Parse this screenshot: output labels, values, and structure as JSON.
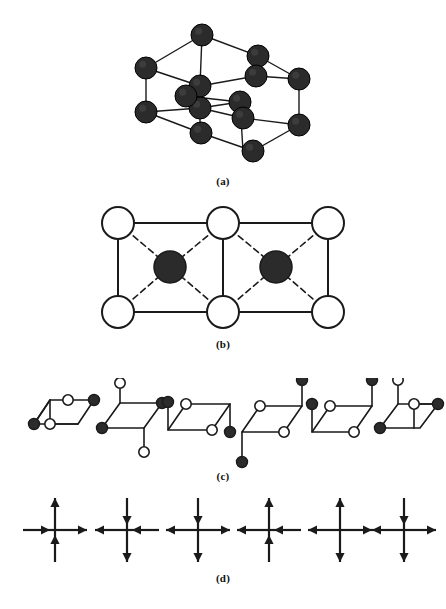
{
  "figure": {
    "colors": {
      "line": "#1a1a1a",
      "filled_atom": "#2b2b2b",
      "open_atom_fill": "#ffffff",
      "background": "#ffffff"
    }
  },
  "panels": [
    {
      "id": "a",
      "label": "(a)",
      "type": "3d-lattice",
      "atom_style": "filled",
      "atom_count": 14,
      "atom_radius": 11,
      "atoms": [
        {
          "cx": 146,
          "cy": 60
        },
        {
          "cx": 202,
          "cy": 27
        },
        {
          "cx": 258,
          "cy": 48
        },
        {
          "cx": 200,
          "cy": 78
        },
        {
          "cx": 256,
          "cy": 68
        },
        {
          "cx": 299,
          "cy": 71
        },
        {
          "cx": 200,
          "cy": 100
        },
        {
          "cx": 240,
          "cy": 94
        },
        {
          "cx": 243,
          "cy": 110
        },
        {
          "cx": 146,
          "cy": 104
        },
        {
          "cx": 201,
          "cy": 125
        },
        {
          "cx": 299,
          "cy": 117
        },
        {
          "cx": 253,
          "cy": 143
        },
        {
          "cx": 186,
          "cy": 88
        }
      ],
      "edges": [
        {
          "x1": 146,
          "y1": 60,
          "x2": 202,
          "y2": 27
        },
        {
          "x1": 202,
          "y1": 27,
          "x2": 258,
          "y2": 48
        },
        {
          "x1": 146,
          "y1": 60,
          "x2": 200,
          "y2": 78
        },
        {
          "x1": 200,
          "y1": 78,
          "x2": 256,
          "y2": 68
        },
        {
          "x1": 256,
          "y1": 68,
          "x2": 299,
          "y2": 71
        },
        {
          "x1": 258,
          "y1": 48,
          "x2": 299,
          "y2": 71
        },
        {
          "x1": 202,
          "y1": 27,
          "x2": 200,
          "y2": 78
        },
        {
          "x1": 146,
          "y1": 60,
          "x2": 146,
          "y2": 104
        },
        {
          "x1": 256,
          "y1": 68,
          "x2": 256,
          "y2": 68
        },
        {
          "x1": 299,
          "y1": 71,
          "x2": 299,
          "y2": 117
        },
        {
          "x1": 146,
          "y1": 104,
          "x2": 201,
          "y2": 125
        },
        {
          "x1": 201,
          "y1": 125,
          "x2": 253,
          "y2": 143
        },
        {
          "x1": 253,
          "y1": 143,
          "x2": 299,
          "y2": 117
        },
        {
          "x1": 146,
          "y1": 104,
          "x2": 200,
          "y2": 100
        },
        {
          "x1": 200,
          "y1": 100,
          "x2": 243,
          "y2": 110
        },
        {
          "x1": 243,
          "y1": 110,
          "x2": 299,
          "y2": 117
        },
        {
          "x1": 200,
          "y1": 78,
          "x2": 200,
          "y2": 125
        },
        {
          "x1": 240,
          "y1": 94,
          "x2": 243,
          "y2": 143
        },
        {
          "x1": 200,
          "y1": 100,
          "x2": 240,
          "y2": 94
        },
        {
          "x1": 186,
          "y1": 88,
          "x2": 240,
          "y2": 94
        }
      ]
    },
    {
      "id": "b",
      "label": "(b)",
      "type": "unit-cell-2d",
      "open_atoms": [
        {
          "cx": 118,
          "cy": 18
        },
        {
          "cx": 223,
          "cy": 18
        },
        {
          "cx": 328,
          "cy": 18
        },
        {
          "cx": 118,
          "cy": 107
        },
        {
          "cx": 223,
          "cy": 107
        },
        {
          "cx": 328,
          "cy": 107
        }
      ],
      "filled_atoms": [
        {
          "cx": 170,
          "cy": 62
        },
        {
          "cx": 276,
          "cy": 62
        }
      ],
      "open_radius": 16,
      "filled_radius": 16,
      "solid_edges": [
        {
          "x1": 118,
          "y1": 18,
          "x2": 328,
          "y2": 18
        },
        {
          "x1": 118,
          "y1": 107,
          "x2": 328,
          "y2": 107
        },
        {
          "x1": 118,
          "y1": 18,
          "x2": 118,
          "y2": 107
        },
        {
          "x1": 223,
          "y1": 18,
          "x2": 223,
          "y2": 107
        },
        {
          "x1": 328,
          "y1": 18,
          "x2": 328,
          "y2": 107
        }
      ],
      "dashed_edges": [
        {
          "x1": 118,
          "y1": 18,
          "x2": 170,
          "y2": 62
        },
        {
          "x1": 223,
          "y1": 18,
          "x2": 170,
          "y2": 62
        },
        {
          "x1": 118,
          "y1": 107,
          "x2": 170,
          "y2": 62
        },
        {
          "x1": 223,
          "y1": 107,
          "x2": 170,
          "y2": 62
        },
        {
          "x1": 223,
          "y1": 18,
          "x2": 276,
          "y2": 62
        },
        {
          "x1": 328,
          "y1": 18,
          "x2": 276,
          "y2": 62
        },
        {
          "x1": 223,
          "y1": 107,
          "x2": 276,
          "y2": 62
        },
        {
          "x1": 328,
          "y1": 107,
          "x2": 276,
          "y2": 62
        }
      ]
    },
    {
      "id": "c",
      "label": "(c)",
      "type": "motif-row",
      "motif_count": 6,
      "motifs": [
        {
          "index": 1,
          "origin_x": 22,
          "origin_y": 0,
          "parallelogram": [
            {
              "x": 12,
              "y": 46
            },
            {
              "x": 28,
              "y": 22
            },
            {
              "x": 72,
              "y": 22
            },
            {
              "x": 56,
              "y": 46
            }
          ],
          "inner_lines": [
            {
              "x1": 28,
              "y1": 22,
              "x2": 28,
              "y2": 46
            },
            {
              "x1": 28,
              "y1": 46,
              "x2": 56,
              "y2": 46
            },
            {
              "x1": 28,
              "y1": 22,
              "x2": 12,
              "y2": 46
            }
          ],
          "stems": [
            {
              "x1": 72,
              "y1": 22,
              "x2": 72,
              "y2": 22
            },
            {
              "x1": 12,
              "y1": 46,
              "x2": 12,
              "y2": 46
            }
          ],
          "open_nodes": [
            {
              "cx": 46,
              "cy": 22
            },
            {
              "cx": 28,
              "cy": 46
            }
          ],
          "filled_nodes": [
            {
              "cx": 72,
              "cy": 22
            },
            {
              "cx": 12,
              "cy": 46
            }
          ]
        },
        {
          "index": 2,
          "origin_x": 92,
          "origin_y": 0,
          "parallelogram": [
            {
              "x": 10,
              "y": 50
            },
            {
              "x": 28,
              "y": 25
            },
            {
              "x": 70,
              "y": 25
            },
            {
              "x": 52,
              "y": 50
            }
          ],
          "inner_lines": [],
          "stems": [
            {
              "x1": 28,
              "y1": 25,
              "x2": 28,
              "y2": 5
            },
            {
              "x1": 52,
              "y1": 50,
              "x2": 52,
              "y2": 74
            }
          ],
          "open_nodes": [
            {
              "cx": 28,
              "cy": 5
            },
            {
              "cx": 52,
              "cy": 74
            }
          ],
          "filled_nodes": [
            {
              "cx": 70,
              "cy": 25
            },
            {
              "cx": 10,
              "cy": 50
            }
          ]
        },
        {
          "index": 3,
          "origin_x": 158,
          "origin_y": 0,
          "parallelogram": [
            {
              "x": 10,
              "y": 52
            },
            {
              "x": 28,
              "y": 26
            },
            {
              "x": 72,
              "y": 26
            },
            {
              "x": 54,
              "y": 52
            }
          ],
          "inner_lines": [],
          "stems": [
            {
              "x1": 10,
              "y1": 52,
              "x2": 10,
              "y2": 24
            },
            {
              "x1": 72,
              "y1": 26,
              "x2": 72,
              "y2": 54
            }
          ],
          "open_nodes": [
            {
              "cx": 28,
              "cy": 26
            },
            {
              "cx": 54,
              "cy": 52
            }
          ],
          "filled_nodes": [
            {
              "cx": 10,
              "cy": 24
            },
            {
              "cx": 72,
              "cy": 54
            }
          ]
        },
        {
          "index": 4,
          "origin_x": 232,
          "origin_y": 0,
          "parallelogram": [
            {
              "x": 10,
              "y": 54
            },
            {
              "x": 28,
              "y": 28
            },
            {
              "x": 70,
              "y": 28
            },
            {
              "x": 52,
              "y": 54
            }
          ],
          "inner_lines": [],
          "stems": [
            {
              "x1": 10,
              "y1": 54,
              "x2": 10,
              "y2": 84
            },
            {
              "x1": 70,
              "y1": 28,
              "x2": 70,
              "y2": 2
            }
          ],
          "open_nodes": [
            {
              "cx": 28,
              "cy": 28
            },
            {
              "cx": 52,
              "cy": 54
            }
          ],
          "filled_nodes": [
            {
              "cx": 10,
              "cy": 84
            },
            {
              "cx": 70,
              "cy": 2
            }
          ]
        },
        {
          "index": 5,
          "origin_x": 302,
          "origin_y": 0,
          "parallelogram": [
            {
              "x": 10,
              "y": 54
            },
            {
              "x": 28,
              "y": 28
            },
            {
              "x": 70,
              "y": 28
            },
            {
              "x": 52,
              "y": 54
            }
          ],
          "inner_lines": [],
          "stems": [
            {
              "x1": 10,
              "y1": 54,
              "x2": 10,
              "y2": 26
            },
            {
              "x1": 70,
              "y1": 28,
              "x2": 70,
              "y2": 2
            }
          ],
          "open_nodes": [
            {
              "cx": 28,
              "cy": 28
            },
            {
              "cx": 52,
              "cy": 54
            }
          ],
          "filled_nodes": [
            {
              "cx": 10,
              "cy": 26
            },
            {
              "cx": 70,
              "cy": 2
            }
          ]
        },
        {
          "index": 6,
          "origin_x": 368,
          "origin_y": 0,
          "parallelogram": [
            {
              "x": 12,
              "y": 50
            },
            {
              "x": 30,
              "y": 26
            },
            {
              "x": 70,
              "y": 26
            },
            {
              "x": 52,
              "y": 50
            }
          ],
          "inner_lines": [
            {
              "x1": 46,
              "y1": 26,
              "x2": 46,
              "y2": 50
            },
            {
              "x1": 46,
              "y1": 26,
              "x2": 70,
              "y2": 26
            }
          ],
          "stems": [
            {
              "x1": 30,
              "y1": 26,
              "x2": 30,
              "y2": 2
            }
          ],
          "open_nodes": [
            {
              "cx": 30,
              "cy": 2
            },
            {
              "cx": 46,
              "cy": 26
            }
          ],
          "filled_nodes": [
            {
              "cx": 12,
              "cy": 50
            },
            {
              "cx": 70,
              "cy": 26
            }
          ]
        }
      ]
    },
    {
      "id": "d",
      "label": "(d)",
      "type": "six-vertex-arrows",
      "vertex_count": 6,
      "arm_length": 32,
      "vertices": [
        {
          "index": 1,
          "cx": 55,
          "cy": 38,
          "arms": {
            "left": "in",
            "right": "out",
            "up": "out",
            "down": "in"
          }
        },
        {
          "index": 2,
          "cx": 127,
          "cy": 38,
          "arms": {
            "left": "out",
            "right": "in",
            "up": "in",
            "down": "out"
          }
        },
        {
          "index": 3,
          "cx": 198,
          "cy": 38,
          "arms": {
            "left": "out",
            "right": "out",
            "up": "in",
            "down": "out"
          }
        },
        {
          "index": 4,
          "cx": 269,
          "cy": 38,
          "arms": {
            "left": "out",
            "right": "in",
            "up": "out",
            "down": "in"
          }
        },
        {
          "index": 5,
          "cx": 340,
          "cy": 38,
          "arms": {
            "left": "out",
            "right": "out",
            "up": "out",
            "down": "out"
          }
        },
        {
          "index": 6,
          "cx": 404,
          "cy": 38,
          "arms": {
            "left": "out",
            "right": "out",
            "up": "in",
            "down": "out"
          }
        }
      ]
    }
  ]
}
